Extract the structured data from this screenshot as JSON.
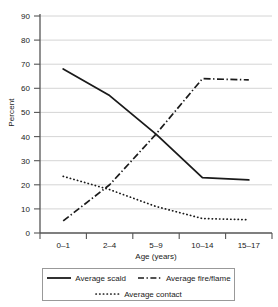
{
  "chart_data": {
    "type": "line",
    "title": "",
    "xlabel": "Age (years)",
    "ylabel": "Percent",
    "categories": [
      "0–1",
      "2–4",
      "5–9",
      "10–14",
      "15–17"
    ],
    "ylim": [
      0,
      90
    ],
    "yticks": [
      0,
      10,
      20,
      30,
      40,
      50,
      60,
      70,
      80,
      90
    ],
    "ytick_labels": [
      "0",
      "10",
      "20",
      "30",
      "40",
      "50",
      "60",
      "70",
      "80",
      "90"
    ],
    "grid": true,
    "legend_position": "bottom",
    "series": [
      {
        "name": "Average scald",
        "style": "solid",
        "color": "#1a1a1a",
        "values": [
          68,
          57,
          41,
          23,
          22
        ]
      },
      {
        "name": "Average fire/flame",
        "style": "dash-dot",
        "color": "#1a1a1a",
        "values": [
          5,
          20,
          41,
          64,
          63.5
        ]
      },
      {
        "name": "Average contact",
        "style": "dotted",
        "color": "#1a1a1a",
        "values": [
          23.5,
          18,
          11,
          6,
          5.5
        ]
      }
    ]
  },
  "axes": {
    "y_title": "Percent",
    "x_title": "Age (years)",
    "y_tick_0": "0",
    "y_tick_10": "10",
    "y_tick_20": "20",
    "y_tick_30": "30",
    "y_tick_40": "40",
    "y_tick_50": "50",
    "y_tick_60": "60",
    "y_tick_70": "70",
    "y_tick_80": "80",
    "y_tick_90": "90",
    "x_tick_0": "0–1",
    "x_tick_1": "2–4",
    "x_tick_2": "5–9",
    "x_tick_3": "10–14",
    "x_tick_4": "15–17"
  },
  "legend": {
    "items": [
      {
        "label": "Average scald",
        "style": "solid"
      },
      {
        "label": "Average fire/flame",
        "style": "dash-dot"
      },
      {
        "label": "Average contact",
        "style": "dotted"
      }
    ]
  },
  "colors": {
    "ink": "#1a1a1a",
    "grid": "#c9c9c9",
    "axis": "#555555",
    "legend_border": "#999999",
    "background": "#ffffff"
  }
}
